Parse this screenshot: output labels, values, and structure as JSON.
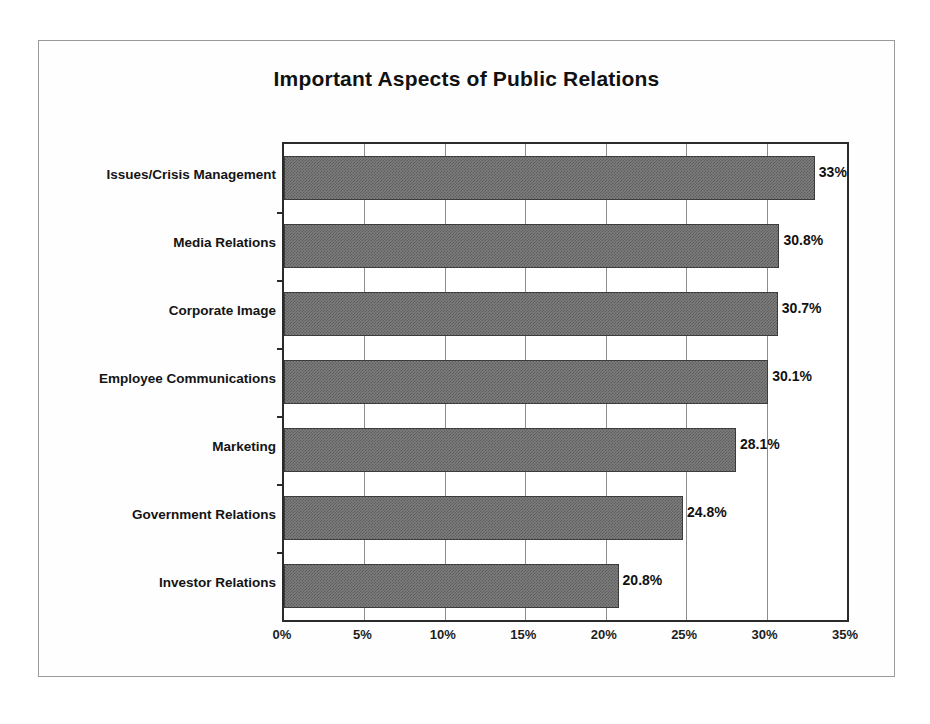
{
  "chart_data": {
    "type": "bar",
    "orientation": "horizontal",
    "title": "Important Aspects of Public Relations",
    "xlabel": "",
    "ylabel": "",
    "xlim": [
      0,
      35
    ],
    "xticks": [
      "0%",
      "5%",
      "10%",
      "15%",
      "20%",
      "25%",
      "30%",
      "35%"
    ],
    "xtick_values": [
      0,
      5,
      10,
      15,
      20,
      25,
      30,
      35
    ],
    "grid": true,
    "grid_axis": "x",
    "legend": false,
    "categories": [
      "Issues/Crisis Management",
      "Media Relations",
      "Corporate Image",
      "Employee Communications",
      "Marketing",
      "Government Relations",
      "Investor Relations"
    ],
    "values": [
      33,
      30.8,
      30.7,
      30.1,
      28.1,
      24.8,
      20.8
    ],
    "data_labels": [
      "33%",
      "30.8%",
      "30.7%",
      "30.1%",
      "28.1%",
      "24.8%",
      "20.8%"
    ],
    "bar_color": "#7d7d7d",
    "bar_border_color": "#3c3c3c",
    "axis_color": "#2b2b2b",
    "grid_color": "#8d8d8d",
    "background_color": "#ffffff"
  }
}
